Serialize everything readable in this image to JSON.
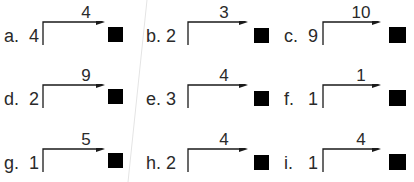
{
  "worksheet": {
    "problems": [
      {
        "label": "a.",
        "start": "4",
        "step": "4",
        "answer": ""
      },
      {
        "label": "b.",
        "start": "2",
        "step": "3",
        "answer": ""
      },
      {
        "label": "c.",
        "start": "9",
        "step": "10",
        "answer": ""
      },
      {
        "label": "d.",
        "start": "2",
        "step": "9",
        "answer": ""
      },
      {
        "label": "e.",
        "start": "3",
        "step": "4",
        "answer": ""
      },
      {
        "label": "f.",
        "start": "1",
        "step": "1",
        "answer": ""
      },
      {
        "label": "g.",
        "start": "1",
        "step": "5",
        "answer": ""
      },
      {
        "label": "h.",
        "start": "2",
        "step": "4",
        "answer": ""
      },
      {
        "label": "i.",
        "start": "1",
        "step": "4",
        "answer": ""
      }
    ]
  },
  "colors": {
    "text": "#2a2a2a",
    "box": "#000000",
    "background": "#ffffff"
  }
}
